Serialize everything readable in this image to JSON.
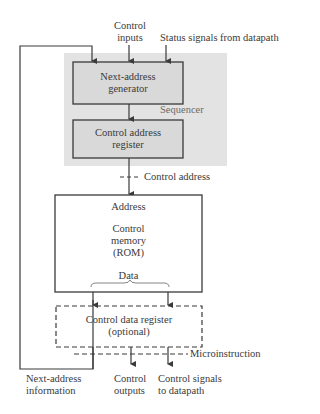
{
  "diagram": {
    "type": "block-diagram",
    "colors": {
      "sequencer_fill": "#e3e3e3",
      "box_fill": "#d9d9d9",
      "stroke": "#3a3a3a",
      "text": "#3a3a3a",
      "label_muted": "#6a6a6a"
    },
    "inputs": {
      "control_inputs_line1": "Control",
      "control_inputs_line2": "inputs",
      "status_signals": "Status signals from datapath"
    },
    "sequencer": {
      "label": "Sequencer",
      "next_address_generator": {
        "line1": "Next-address",
        "line2": "generator"
      },
      "control_address_register": {
        "line1": "Control address",
        "line2": "register"
      }
    },
    "control_address_label": "Control address",
    "control_memory": {
      "address_label": "Address",
      "line1": "Control",
      "line2": "memory",
      "line3": "(ROM)",
      "data_label": "Data"
    },
    "control_data_register": {
      "line1": "Control data register",
      "line2": "(optional)"
    },
    "microinstruction_label": "Microinstruction",
    "outputs": {
      "next_address_info_line1": "Next-address",
      "next_address_info_line2": "information",
      "control_outputs_line1": "Control",
      "control_outputs_line2": "outputs",
      "control_signals_line1": "Control signals",
      "control_signals_line2": "to datapath"
    }
  }
}
